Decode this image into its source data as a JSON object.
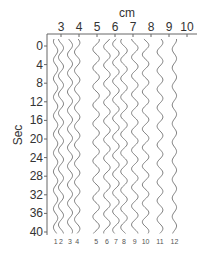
{
  "chart_data": {
    "type": "line",
    "title": "",
    "xlabel": "cm",
    "ylabel": "Sec",
    "x_axis_position": "top",
    "xlim": [
      2,
      10.5
    ],
    "ylim": [
      0,
      40
    ],
    "y_inverted": true,
    "x_ticks": [
      3,
      4,
      5,
      6,
      7,
      8,
      9,
      10
    ],
    "x_tick_labels": [
      "3",
      "4",
      "5",
      "6",
      "7",
      "8",
      "9",
      "10"
    ],
    "y_ticks": [
      0,
      4,
      8,
      12,
      16,
      20,
      24,
      28,
      32,
      36,
      40
    ],
    "y_tick_labels": [
      "0",
      "4",
      "8",
      "12",
      "16",
      "20",
      "24",
      "28",
      "32",
      "36",
      "40"
    ],
    "grid": false,
    "legend": "none",
    "series": [
      {
        "name": "1",
        "label": "1",
        "x_center": 2.7,
        "amplitude_cm": 0.12,
        "period_sec": 4.0
      },
      {
        "name": "2",
        "label": "2",
        "x_center": 3.0,
        "amplitude_cm": 0.14,
        "period_sec": 4.0
      },
      {
        "name": "3",
        "label": "3",
        "x_center": 3.5,
        "amplitude_cm": 0.14,
        "period_sec": 4.0
      },
      {
        "name": "4",
        "label": "4",
        "x_center": 3.9,
        "amplitude_cm": 0.15,
        "period_sec": 4.0
      },
      {
        "name": "5",
        "label": "5",
        "x_center": 4.95,
        "amplitude_cm": 0.18,
        "period_sec": 4.0
      },
      {
        "name": "6",
        "label": "6",
        "x_center": 5.55,
        "amplitude_cm": 0.18,
        "period_sec": 4.0
      },
      {
        "name": "7",
        "label": "7",
        "x_center": 6.05,
        "amplitude_cm": 0.18,
        "period_sec": 4.0
      },
      {
        "name": "8",
        "label": "8",
        "x_center": 6.5,
        "amplitude_cm": 0.18,
        "period_sec": 4.0
      },
      {
        "name": "9",
        "label": "9",
        "x_center": 7.1,
        "amplitude_cm": 0.18,
        "period_sec": 4.0
      },
      {
        "name": "10",
        "label": "10",
        "x_center": 7.7,
        "amplitude_cm": 0.18,
        "period_sec": 4.0
      },
      {
        "name": "11",
        "label": "11",
        "x_center": 8.5,
        "amplitude_cm": 0.16,
        "period_sec": 4.0
      },
      {
        "name": "12",
        "label": "12",
        "x_center": 9.3,
        "amplitude_cm": 0.12,
        "period_sec": 4.0
      }
    ],
    "colors": {
      "trace": "#7a7a7a",
      "axis": "#666666",
      "text": "#333333"
    }
  }
}
